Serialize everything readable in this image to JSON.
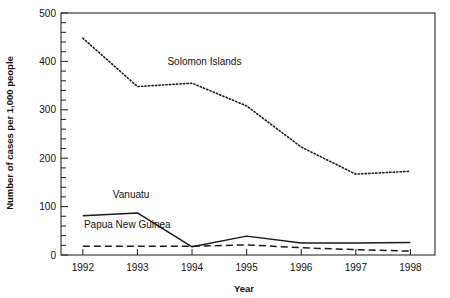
{
  "chart_data": {
    "type": "line",
    "title": "",
    "xlabel": "Year",
    "ylabel": "Number of cases per 1,000 people",
    "x": [
      1992,
      1993,
      1994,
      1995,
      1996,
      1997,
      1998
    ],
    "xticklabels": [
      "1992",
      "1993",
      "1994",
      "1995",
      "1996",
      "1997",
      "1998"
    ],
    "yticklabels": [
      "0",
      "100",
      "200",
      "300",
      "400",
      "500"
    ],
    "ytickvalues": [
      0,
      100,
      200,
      300,
      400,
      500
    ],
    "yminor_step": 20,
    "xlim": [
      1991.6,
      1998.45
    ],
    "ylim": [
      0,
      500
    ],
    "grid": false,
    "legend_position": "inline-annotations",
    "series": [
      {
        "name": "Solomon Islands",
        "style": "dotted",
        "color": "#1a1a1a",
        "values": [
          448,
          348,
          355,
          308,
          223,
          167,
          173
        ],
        "label_x": 1993.55,
        "label_y": 392
      },
      {
        "name": "Vanuatu",
        "style": "solid",
        "color": "#1a1a1a",
        "values": [
          81,
          87,
          17,
          39,
          25,
          25,
          26
        ],
        "label_x": 1992.55,
        "label_y": 118
      },
      {
        "name": "Papua New Guinea",
        "style": "dashed",
        "color": "#1a1a1a",
        "values": [
          18,
          18,
          18,
          21,
          15,
          11,
          8
        ],
        "label_x": 1992.02,
        "label_y": 56
      }
    ]
  },
  "colors": {
    "axis": "#2b2b2b",
    "text": "#111111",
    "background": "#ffffff"
  }
}
